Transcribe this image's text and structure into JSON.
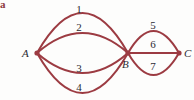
{
  "figure": {
    "marker": "a",
    "background_color": "#fdfdfc",
    "edge_color": "#9c3b42",
    "text_color": "#2b2b33"
  },
  "graph": {
    "type": "multigraph",
    "vertices": [
      {
        "id": "A",
        "label": "A",
        "x": 37,
        "y": 53
      },
      {
        "id": "B",
        "label": "B",
        "x": 128,
        "y": 53
      },
      {
        "id": "C",
        "label": "C",
        "x": 179,
        "y": 53
      }
    ],
    "edges": [
      {
        "id": "1",
        "label": "1",
        "from": "A",
        "to": "B",
        "shape": "arc",
        "bow": -40,
        "label_x": 79,
        "label_y": 4
      },
      {
        "id": "2",
        "label": "2",
        "from": "A",
        "to": "B",
        "shape": "arc",
        "bow": -20,
        "label_x": 79,
        "label_y": 22
      },
      {
        "id": "3",
        "label": "3",
        "from": "A",
        "to": "B",
        "shape": "arc",
        "bow": 20,
        "label_x": 79,
        "label_y": 63
      },
      {
        "id": "4",
        "label": "4",
        "from": "A",
        "to": "B",
        "shape": "arc",
        "bow": 40,
        "label_x": 79,
        "label_y": 82
      },
      {
        "id": "5",
        "label": "5",
        "from": "B",
        "to": "C",
        "shape": "arc",
        "bow": -22,
        "label_x": 153,
        "label_y": 20
      },
      {
        "id": "6",
        "label": "6",
        "from": "B",
        "to": "C",
        "shape": "straight",
        "bow": 0,
        "label_x": 153,
        "label_y": 39
      },
      {
        "id": "7",
        "label": "7",
        "from": "B",
        "to": "C",
        "shape": "arc",
        "bow": 22,
        "label_x": 153,
        "label_y": 61
      }
    ],
    "vertex_labels": [
      {
        "id": "A",
        "text": "A",
        "x": 22,
        "y": 48
      },
      {
        "id": "B",
        "text": "B",
        "x": 122,
        "y": 59
      },
      {
        "id": "C",
        "text": "C",
        "x": 184,
        "y": 48
      }
    ]
  }
}
